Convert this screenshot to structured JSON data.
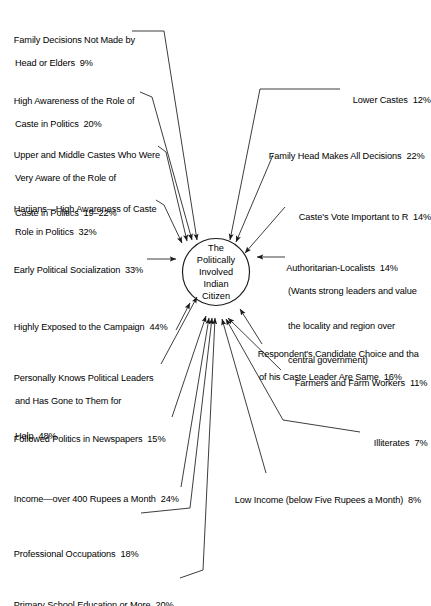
{
  "figure": {
    "center_node": {
      "lines": [
        "The",
        "Politically",
        "Involved",
        "Indian",
        "Citizen"
      ]
    },
    "left_labels": [
      {
        "id": "family-decisions-not-made",
        "lines": [
          "Family Decisions Not Made by",
          "Head or Elders  9%"
        ],
        "value": "9%"
      },
      {
        "id": "high-awareness-caste-role",
        "lines": [
          "High Awareness of the Role of",
          "Caste in Politics  20%"
        ],
        "value": "20%"
      },
      {
        "id": "upper-middle-castes-aware",
        "lines": [
          "Upper and Middle Castes Who Were",
          "Very Aware of the Role of",
          "Caste in Politics  19–22%"
        ],
        "value": "19–22%"
      },
      {
        "id": "harijans-high-awareness",
        "lines": [
          "Harijans—High Awareness of Caste",
          "Role in Politics  32%"
        ],
        "value": "32%"
      },
      {
        "id": "early-political-socialization",
        "lines": [
          "Early Political Socialization  33%"
        ],
        "value": "33%"
      },
      {
        "id": "highly-exposed-campaign",
        "lines": [
          "Highly Exposed to the Campaign  44%"
        ],
        "value": "44%"
      },
      {
        "id": "personally-knows-leaders",
        "lines": [
          "Personally Knows Political Leaders",
          "and Has Gone to Them for",
          "Help  48%"
        ],
        "value": "48%"
      },
      {
        "id": "followed-politics-newspapers",
        "lines": [
          "Followed Politics in Newspapers  15%"
        ],
        "value": "15%"
      },
      {
        "id": "income-over-400-rupees",
        "lines": [
          "Income—over 400 Rupees a Month  24%"
        ],
        "value": "24%"
      },
      {
        "id": "professional-occupations",
        "lines": [
          "Professional Occupations  18%"
        ],
        "value": "18%"
      },
      {
        "id": "primary-school-education",
        "lines": [
          "Primary School Education or More  20%"
        ],
        "value": "20%"
      }
    ],
    "right_labels": [
      {
        "id": "lower-castes",
        "lines": [
          "Lower Castes  12%"
        ],
        "value": "12%"
      },
      {
        "id": "family-head-all-decisions",
        "lines": [
          "Family Head Makes All Decisions  22%"
        ],
        "value": "22%"
      },
      {
        "id": "castes-vote-important",
        "lines": [
          "Caste's Vote Important to R  14%"
        ],
        "value": "14%"
      },
      {
        "id": "authoritarian-localists",
        "lines": [
          "Authoritarian-Localists  14%",
          "(Wants strong leaders and value",
          "the locality and region over",
          "central government)"
        ],
        "value": "14%"
      },
      {
        "id": "candidate-choice-same-as-caste-leader",
        "lines": [
          "Respondent's Candidate Choice and tha",
          "of his Caste Leader Are Same  16%"
        ],
        "value": "16%"
      },
      {
        "id": "farmers-farm-workers",
        "lines": [
          "Farmers and Farm Workers  11%"
        ],
        "value": "11%"
      },
      {
        "id": "illiterates",
        "lines": [
          "Illiterates  7%"
        ],
        "value": "7%"
      },
      {
        "id": "low-income",
        "lines": [
          "Low Income (below Five Rupees a Month)  8%"
        ],
        "value": "8%"
      }
    ],
    "colors": {
      "stroke": "#1a1a1a",
      "background": "#ffffff",
      "text": "#000000"
    }
  }
}
